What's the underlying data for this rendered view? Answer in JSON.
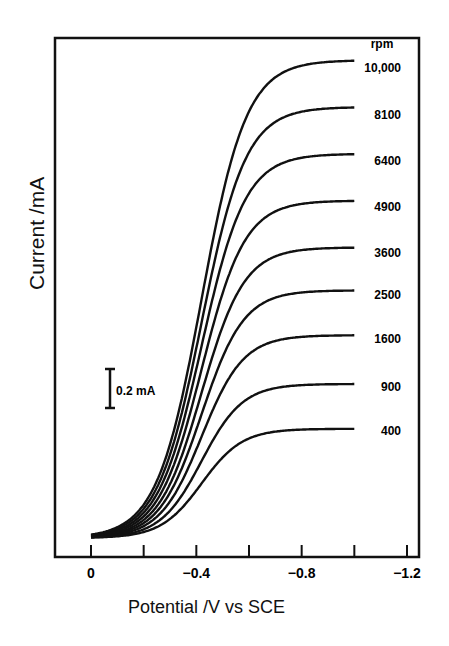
{
  "chart_data": {
    "type": "line",
    "title": "",
    "xlabel": "Potential /V vs SCE",
    "ylabel": "Current /mA",
    "xlim": [
      0,
      -1.2
    ],
    "x_ticks": [
      0,
      -0.2,
      -0.4,
      -0.6,
      -0.8,
      -1.0,
      -1.2
    ],
    "x_tick_labels": [
      "0",
      "-0.4",
      "-0.8",
      "-1.2"
    ],
    "grid": false,
    "legend_title": "rpm",
    "scale_bar": {
      "label": "0.2 mA",
      "value_mA": 0.2
    },
    "half_wave_potential": -0.42,
    "x_range_plotted": [
      0,
      -1.0
    ],
    "series": [
      {
        "name": "10,000",
        "rpm": 10000,
        "limiting_current_mA": 2.45
      },
      {
        "name": "8100",
        "rpm": 8100,
        "limiting_current_mA": 2.21
      },
      {
        "name": "6400",
        "rpm": 6400,
        "limiting_current_mA": 1.97
      },
      {
        "name": "4900",
        "rpm": 4900,
        "limiting_current_mA": 1.73
      },
      {
        "name": "3600",
        "rpm": 3600,
        "limiting_current_mA": 1.49
      },
      {
        "name": "2500",
        "rpm": 2500,
        "limiting_current_mA": 1.27
      },
      {
        "name": "1600",
        "rpm": 1600,
        "limiting_current_mA": 1.04
      },
      {
        "name": "900",
        "rpm": 900,
        "limiting_current_mA": 0.79
      },
      {
        "name": "400",
        "rpm": 400,
        "limiting_current_mA": 0.56
      }
    ]
  }
}
